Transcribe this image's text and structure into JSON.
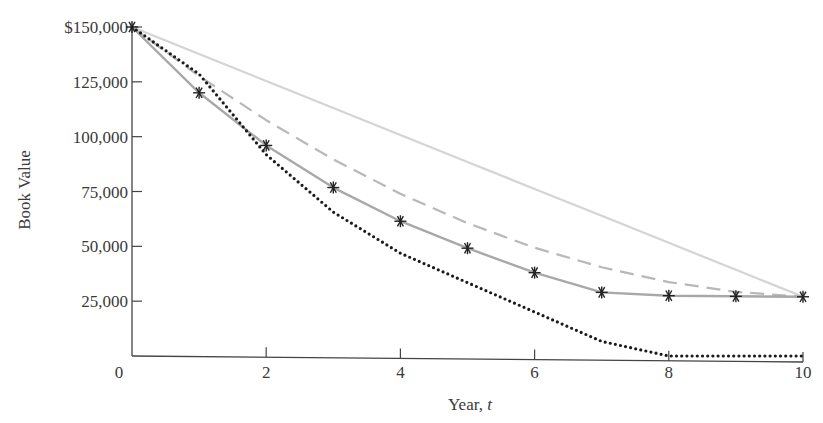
{
  "chart_data": {
    "type": "line",
    "title": "",
    "xlabel": "Year, t",
    "ylabel": "Book Value",
    "x": [
      0,
      1,
      2,
      3,
      4,
      5,
      6,
      7,
      8,
      9,
      10
    ],
    "xticks": [
      0,
      2,
      4,
      6,
      8,
      10
    ],
    "xtick_labels": [
      "0",
      "2",
      "4",
      "6",
      "8",
      "10"
    ],
    "yticks": [
      25000,
      50000,
      75000,
      100000,
      125000,
      150000
    ],
    "ytick_labels": [
      "25,000",
      "50,000",
      "75,000",
      "100,000",
      "125,000",
      "$150,000"
    ],
    "xlim": [
      0,
      10
    ],
    "ylim": [
      0,
      150000
    ],
    "grid": false,
    "legend": "none",
    "series": [
      {
        "name": "Straight-line",
        "style": "solid-light",
        "color": "#d4d4d4",
        "values": [
          150000,
          137700,
          125400,
          113100,
          100800,
          88500,
          76200,
          63900,
          51600,
          39300,
          27000
        ]
      },
      {
        "name": "Sum-of-years'-digits",
        "style": "dashed",
        "color": "#b8b8b8",
        "values": [
          150000,
          127636,
          107509,
          89618,
          73964,
          60545,
          49364,
          40418,
          33709,
          29236,
          27000
        ]
      },
      {
        "name": "Double-declining balance (switch to SL)",
        "style": "solid-with-asterisk-markers",
        "color": "#a8a8a8",
        "marker_color": "#222222",
        "values": [
          150000,
          120000,
          96000,
          76800,
          61440,
          49152,
          38000,
          29000,
          27500,
          27200,
          27000
        ]
      },
      {
        "name": "MACRS",
        "style": "dotted",
        "color": "#1a1a1a",
        "values": [
          150000,
          128565,
          91830,
          65595,
          46860,
          33465,
          20070,
          6675,
          0,
          0,
          0
        ]
      }
    ]
  }
}
